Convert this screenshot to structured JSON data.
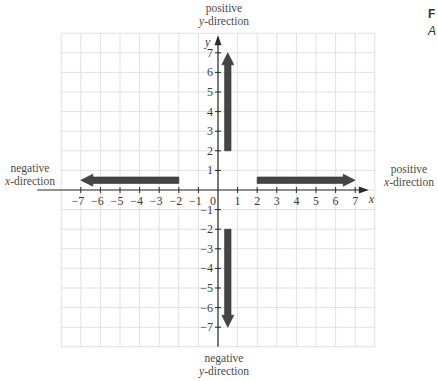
{
  "labels": {
    "pos_y": {
      "line1": "positive",
      "var": "y",
      "rest": "-direction"
    },
    "neg_y": {
      "line1": "negative",
      "var": "y",
      "rest": "-direction"
    },
    "pos_x": {
      "line1": "positive",
      "var": "x",
      "rest": "-direction"
    },
    "neg_x": {
      "line1": "negative",
      "var": "x",
      "rest": "-direction"
    }
  },
  "edge_letters": {
    "top": "F",
    "bottom": "A"
  },
  "axes": {
    "x_label": "x",
    "y_label": "y",
    "x_ticks": [
      -7,
      -6,
      -5,
      -4,
      -3,
      -2,
      -1,
      1,
      2,
      3,
      4,
      5,
      6,
      7
    ],
    "y_ticks": [
      7,
      6,
      5,
      4,
      3,
      2,
      1,
      -1,
      -2,
      -3,
      -4,
      -5,
      -6,
      -7
    ],
    "origin_label": "0",
    "grid_range": [
      -8,
      8
    ]
  },
  "arrows": [
    {
      "name": "arrow-positive-y",
      "from": [
        0.5,
        2
      ],
      "to": [
        0.5,
        7
      ]
    },
    {
      "name": "arrow-negative-y",
      "from": [
        0.5,
        -2
      ],
      "to": [
        0.5,
        -7
      ]
    },
    {
      "name": "arrow-positive-x",
      "from": [
        2,
        0.5
      ],
      "to": [
        7,
        0.5
      ]
    },
    {
      "name": "arrow-negative-x",
      "from": [
        -2,
        0.5
      ],
      "to": [
        -7,
        0.5
      ]
    }
  ],
  "colors": {
    "grid": "#d9d9d9",
    "axis": "#2b2b2b",
    "arrow": "#454545",
    "text": "#3a3a3a"
  }
}
